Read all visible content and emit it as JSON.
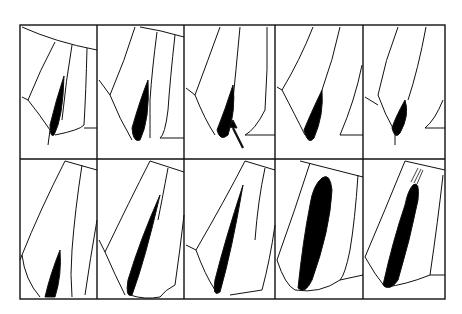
{
  "figure": {
    "rows": 2,
    "cols": 5,
    "panels": [
      {
        "row": 1,
        "col": 1,
        "lesion": "small elongated dark area at apex"
      },
      {
        "row": 1,
        "col": 2,
        "lesion": "small elongated dark area at apex"
      },
      {
        "row": 1,
        "col": 3,
        "lesion": "small dark area with arrow marker"
      },
      {
        "row": 1,
        "col": 4,
        "lesion": "small dark area at apex"
      },
      {
        "row": 1,
        "col": 5,
        "lesion": "small dark area at apex"
      },
      {
        "row": 2,
        "col": 1,
        "lesion": "narrow dark streak at base"
      },
      {
        "row": 2,
        "col": 2,
        "lesion": "long dark streak"
      },
      {
        "row": 2,
        "col": 3,
        "lesion": "long dark streak"
      },
      {
        "row": 2,
        "col": 4,
        "lesion": "full-length wide dark band"
      },
      {
        "row": 2,
        "col": 5,
        "lesion": "full-length dark band with hatched tip"
      }
    ],
    "annotations": {
      "arrow": "pointer in row 1 column 3"
    },
    "colors": {
      "ink": "#000000",
      "background": "#ffffff"
    }
  }
}
